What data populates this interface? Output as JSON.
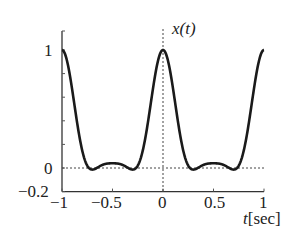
{
  "chart_data": {
    "type": "line",
    "title": "",
    "curve_label": "x(t)",
    "xlabel": "t[sec]",
    "ylabel": "",
    "xlim": [
      -1,
      1
    ],
    "ylim": [
      -0.2,
      1.1
    ],
    "xticks": [
      -1,
      -0.5,
      0,
      0.5,
      1
    ],
    "xtick_labels": [
      "−1",
      "−0.5",
      "0",
      "0.5",
      "1"
    ],
    "yticks": [
      -0.2,
      0,
      1
    ],
    "ytick_labels": [
      "−0.2",
      "0",
      "1"
    ],
    "grid": false,
    "reference_lines": [
      {
        "orientation": "horizontal",
        "value": 0,
        "style": "dotted"
      },
      {
        "orientation": "vertical",
        "value": 0,
        "style": "dotted"
      }
    ],
    "series": [
      {
        "name": "x(t)",
        "x": [
          -1,
          -0.9,
          -0.8,
          -0.7,
          -0.667,
          -0.6,
          -0.5,
          -0.4,
          -0.333,
          -0.3,
          -0.2,
          -0.1,
          0,
          0.1,
          0.2,
          0.3,
          0.333,
          0.4,
          0.5,
          0.6,
          0.667,
          0.7,
          0.8,
          0.9,
          1
        ],
        "values": [
          1,
          0.73,
          0.24,
          -0.03,
          -0.05,
          -0.03,
          0.04,
          -0.03,
          -0.05,
          -0.03,
          0.24,
          0.73,
          1,
          0.73,
          0.24,
          -0.03,
          -0.05,
          -0.03,
          0.04,
          -0.03,
          -0.05,
          -0.03,
          0.24,
          0.73,
          1
        ]
      }
    ]
  },
  "labels": {
    "curve": "x(t)",
    "x_axis": "t[sec]",
    "y_ticks": [
      "1",
      "0",
      "−0.2"
    ],
    "x_ticks": [
      "−1",
      "−0.5",
      "0",
      "0.5",
      "1"
    ]
  }
}
